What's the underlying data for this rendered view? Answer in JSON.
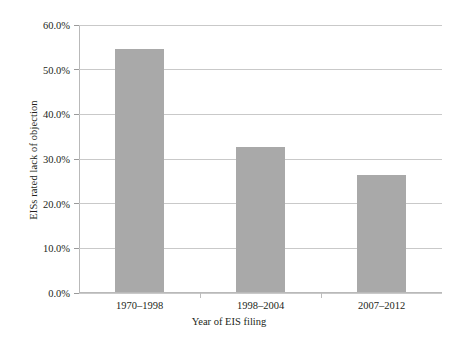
{
  "chart_data": {
    "type": "bar",
    "title": "",
    "subtitle": "",
    "xlabel": "Year of EIS filing",
    "ylabel": "EISs rated lack of objection",
    "categories": [
      "1970–1998",
      "1998–2004",
      "2007–2012"
    ],
    "values": [
      0.545,
      0.325,
      0.261
    ],
    "value_labels": [
      "54.5%",
      "32.5%",
      "26.1%"
    ],
    "ylim": [
      0,
      0.6
    ],
    "ytick_values": [
      0,
      0.1,
      0.2,
      0.3,
      0.4,
      0.5,
      0.6
    ],
    "ytick_labels": [
      "0.0%",
      "10.0%",
      "20.0%",
      "30.0%",
      "40.0%",
      "50.0%",
      "60.0%"
    ],
    "grid": "horizontal",
    "legend": "none",
    "bar_color": "#a9a9a9",
    "gridline_color": "#c9c9c9",
    "axis_color": "#b9b9b9",
    "text_color": "#231f20",
    "background_color": "#ffffff"
  }
}
